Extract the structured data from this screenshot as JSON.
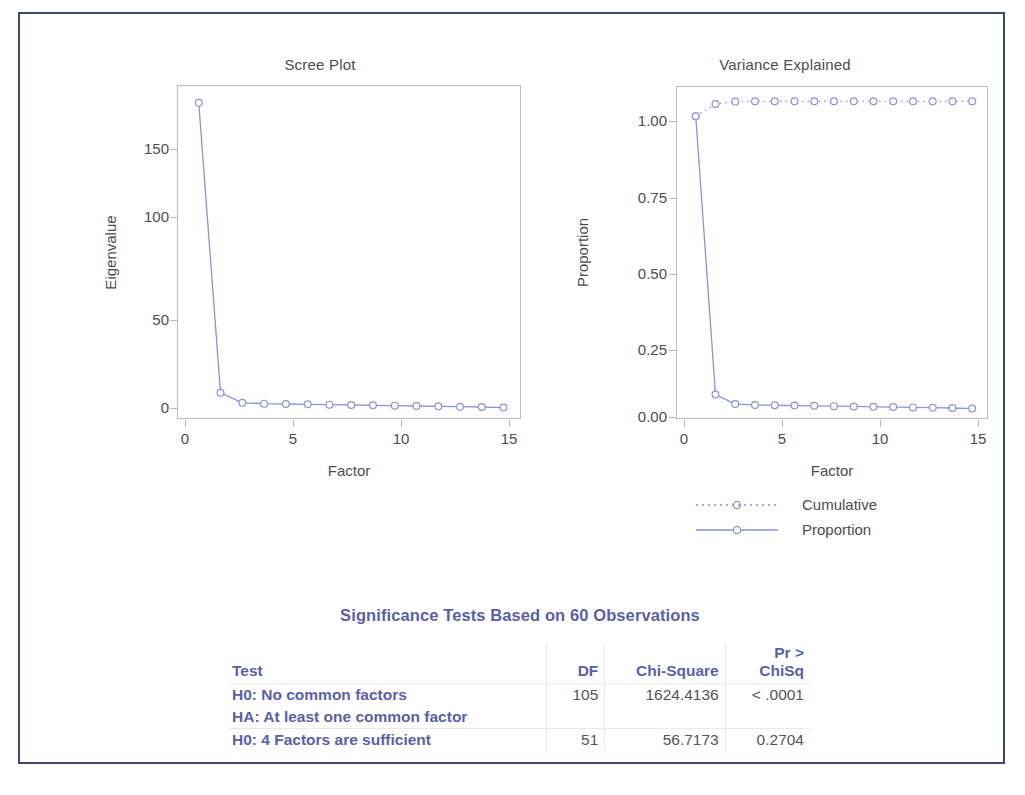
{
  "colors": {
    "frame": "#3b4a6b",
    "series": "#8b93d8",
    "axis": "#b9bcc4",
    "text": "#4d4d4d",
    "table_accent": "#5a5fa8"
  },
  "scree": {
    "title": "Scree Plot",
    "xlabel": "Factor",
    "ylabel": "Eigenvalue",
    "xticks": [
      "0",
      "5",
      "10",
      "15"
    ],
    "yticks": [
      "0",
      "50",
      "100",
      "150"
    ]
  },
  "variance": {
    "title": "Variance Explained",
    "xlabel": "Factor",
    "ylabel": "Proportion",
    "xticks": [
      "0",
      "5",
      "10",
      "15"
    ],
    "yticks": [
      "0.00",
      "0.25",
      "0.50",
      "0.75",
      "1.00"
    ]
  },
  "legend": {
    "cumulative_label": "Cumulative",
    "proportion_label": "Proportion"
  },
  "table": {
    "title": "Significance Tests Based on 60 Observations",
    "headers": {
      "test": "Test",
      "df": "DF",
      "chisq": "Chi-Square",
      "pr_line1": "Pr >",
      "pr_line2": "ChiSq"
    },
    "rows": [
      {
        "test": "H0: No common factors",
        "test2": "HA: At least one common factor",
        "df": "105",
        "chisq": "1624.4136",
        "pr": "< .0001"
      },
      {
        "test": "H0: 4 Factors are sufficient",
        "test2": "",
        "df": "51",
        "chisq": "56.7173",
        "pr": "0.2704"
      }
    ]
  },
  "chart_data": [
    {
      "type": "line",
      "title": "Scree Plot",
      "xlabel": "Factor",
      "ylabel": "Eigenvalue",
      "xlim": [
        0,
        15.8
      ],
      "ylim": [
        -8,
        190
      ],
      "xticks": [
        0,
        5,
        10,
        15
      ],
      "yticks": [
        0,
        50,
        100,
        150
      ],
      "grid": false,
      "marker": "open-circle",
      "series": [
        {
          "name": "Eigenvalue",
          "x": [
            1,
            2,
            3,
            4,
            5,
            6,
            7,
            8,
            9,
            10,
            11,
            12,
            13,
            14,
            15
          ],
          "values": [
            179.5,
            7.5,
            1.6,
            1.1,
            0.9,
            0.7,
            0.5,
            0.3,
            0.1,
            -0.1,
            -0.3,
            -0.5,
            -0.7,
            -0.9,
            -1.2
          ]
        }
      ]
    },
    {
      "type": "line",
      "title": "Variance Explained",
      "xlabel": "Factor",
      "ylabel": "Proportion",
      "xlim": [
        0,
        15.8
      ],
      "ylim": [
        -0.04,
        1.05
      ],
      "xticks": [
        0,
        5,
        10,
        15
      ],
      "yticks": [
        0.0,
        0.25,
        0.5,
        0.75,
        1.0
      ],
      "grid": false,
      "legend_position": "below-right",
      "series": [
        {
          "name": "Cumulative",
          "style": "dotted",
          "x": [
            1,
            2,
            3,
            4,
            5,
            6,
            7,
            8,
            9,
            10,
            11,
            12,
            13,
            14,
            15
          ],
          "values": [
            0.951,
            0.991,
            0.999,
            1.0,
            1.0,
            1.0,
            1.0,
            1.0,
            1.0,
            1.0,
            1.0,
            1.0,
            1.0,
            1.0,
            1.0
          ]
        },
        {
          "name": "Proportion",
          "style": "solid",
          "x": [
            1,
            2,
            3,
            4,
            5,
            6,
            7,
            8,
            9,
            10,
            11,
            12,
            13,
            14,
            15
          ],
          "values": [
            0.951,
            0.04,
            0.009,
            0.006,
            0.005,
            0.004,
            0.003,
            0.002,
            0.001,
            0.0,
            -0.001,
            -0.002,
            -0.003,
            -0.004,
            -0.006
          ]
        }
      ]
    }
  ]
}
